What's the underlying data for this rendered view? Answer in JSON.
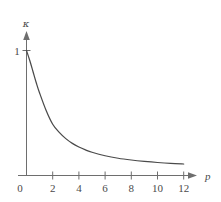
{
  "figure": {
    "name": "kappa-vs-p-decay-plot",
    "background": "#ffffff",
    "line_color": "#4a4a4a",
    "axis_color": "#6e6e6e"
  },
  "chart_data": {
    "type": "line",
    "title": "",
    "xlabel": "p",
    "ylabel": "κ",
    "xlim": [
      0,
      12.6
    ],
    "ylim": [
      0,
      1.18
    ],
    "grid": false,
    "legend": null,
    "x_ticks": [
      0,
      2,
      4,
      6,
      8,
      10,
      12
    ],
    "x_tick_labels": [
      "0",
      "2",
      "4",
      "6",
      "8",
      "10",
      "12"
    ],
    "y_ticks": [
      1
    ],
    "y_tick_labels": [
      "1"
    ],
    "origin_label": "0",
    "series": [
      {
        "name": "kappa",
        "x": [
          0,
          0.25,
          0.5,
          0.75,
          1,
          1.5,
          2,
          2.5,
          3,
          3.5,
          4,
          4.5,
          5,
          6,
          7,
          8,
          9,
          10,
          11,
          12
        ],
        "y": [
          1.0,
          0.92,
          0.83,
          0.74,
          0.66,
          0.52,
          0.41,
          0.345,
          0.295,
          0.257,
          0.228,
          0.205,
          0.186,
          0.158,
          0.138,
          0.124,
          0.113,
          0.104,
          0.097,
          0.092
        ]
      }
    ],
    "annotations": []
  },
  "axis_labels": {
    "y_axis_symbol": "κ",
    "x_axis_symbol": "p",
    "y_one": "1",
    "origin": "0",
    "x2": "2",
    "x4": "4",
    "x6": "6",
    "x8": "8",
    "x10": "10",
    "x12": "12"
  }
}
